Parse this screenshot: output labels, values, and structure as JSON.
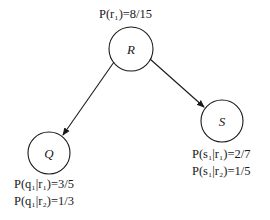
{
  "diagram": {
    "type": "bayesian-network",
    "nodes": [
      {
        "id": "R",
        "label": "R",
        "cx": 131,
        "cy": 49,
        "r": 22
      },
      {
        "id": "Q",
        "label": "Q",
        "cx": 49,
        "cy": 153,
        "r": 21
      },
      {
        "id": "S",
        "label": "S",
        "cx": 222,
        "cy": 121,
        "r": 21
      }
    ],
    "edges": [
      {
        "from": "R",
        "to": "Q"
      },
      {
        "from": "R",
        "to": "S"
      }
    ],
    "probabilities": {
      "R": [
        "P(r₁)=8/15"
      ],
      "Q": [
        "P(q₁|r₁)=3/5",
        "P(q₁|r₂)=1/3"
      ],
      "S": [
        "P(s₁|r₁)=2/7",
        "P(s₁|r₂)=1/5"
      ]
    },
    "colors": {
      "stroke": "#1a1a1a",
      "background": "#ffffff"
    }
  }
}
